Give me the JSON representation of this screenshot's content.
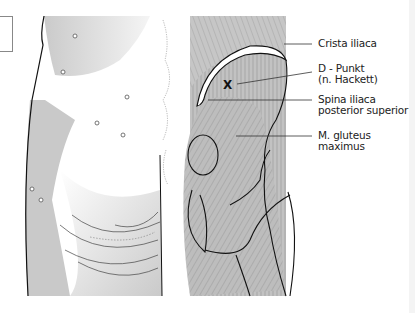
{
  "figure": {
    "type": "anatomical-diagram",
    "region": "posterior pelvis / gluteal region",
    "marker": "X",
    "labels": [
      {
        "id": "crista-iliaca",
        "text": "Crista iliaca"
      },
      {
        "id": "d-punkt",
        "line1": "D - Punkt",
        "line2": "(n. Hackett)"
      },
      {
        "id": "spina-iliaca",
        "line1": "Spina iliaca",
        "line2": "posterior superior"
      },
      {
        "id": "gluteus-maximus",
        "line1": "M. gluteus",
        "line2": "maximus"
      }
    ],
    "colors": {
      "skin_shade": "#c8c8c8",
      "muscle_fill": "#bdbdbd",
      "outline": "#1a1a1a",
      "leader_line": "#333333",
      "background": "#ffffff"
    }
  }
}
